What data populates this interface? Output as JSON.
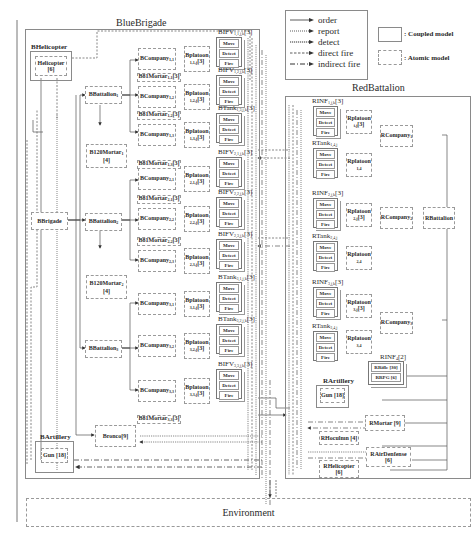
{
  "legend": {
    "edges": [
      {
        "label": "order",
        "style": "solid"
      },
      {
        "label": "report",
        "style": "dotted"
      },
      {
        "label": "detect",
        "style": "dense-dotted"
      },
      {
        "label": "direct fire",
        "style": "dashed"
      },
      {
        "label": "indirect fire",
        "style": "dash-dot"
      }
    ],
    "models": [
      {
        "label": ": Coupled model",
        "style": "solid-box"
      },
      {
        "label": ": Atomic model",
        "style": "dashed-box"
      }
    ]
  },
  "blue": {
    "title": "BlueBrigade",
    "helicopter_group": "BHelicopter",
    "helicopter": "Helicopter",
    "helicopter_count": "[6]",
    "brigade": "BBrigade",
    "battalion1": "BBattalion",
    "battalion1_sub": "1",
    "battalion2": "BBattalion",
    "battalion2_sub": "2",
    "battalion3": "BBattalion",
    "battalion3_sub": "3",
    "mortar120_1": "B120Mortar",
    "mortar120_1_sub": "1",
    "mortar120_1_count": "[4]",
    "mortar120_2": "B120Mortar",
    "mortar120_2_sub": "2",
    "mortar120_2_count": "[4]",
    "bronco": "Bronco[9]",
    "artillery_group": "BArtillery",
    "gun": "Gun [18]",
    "companies": [
      {
        "name": "BCompany",
        "sub": "1,1"
      },
      {
        "name": "BCompany",
        "sub": "1,2"
      },
      {
        "name": "BCompany",
        "sub": "1,3"
      },
      {
        "name": "BCompany",
        "sub": "2,1"
      },
      {
        "name": "BCompany",
        "sub": "2,2"
      },
      {
        "name": "BCompany",
        "sub": "2,3"
      },
      {
        "name": "BCompany",
        "sub": "3,1"
      },
      {
        "name": "BCompany",
        "sub": "3,2"
      },
      {
        "name": "BCompany",
        "sub": "3,3"
      }
    ],
    "platoons": [
      {
        "name": "Bplatoon",
        "sub": "1,1,j",
        "count": "[3]"
      },
      {
        "name": "Bplatoon",
        "sub": "1,2,j",
        "count": "[3]"
      },
      {
        "name": "Bplatoon",
        "sub": "1,3,j",
        "count": "[3]"
      },
      {
        "name": "Bplatoon",
        "sub": "2,1,j",
        "count": "[3]"
      },
      {
        "name": "Bplatoon",
        "sub": "2,2,j",
        "count": "[3]"
      },
      {
        "name": "Bplatoon",
        "sub": "2,3,j",
        "count": "[3]"
      },
      {
        "name": "Bplatoon",
        "sub": "3,1,j",
        "count": "[3]"
      },
      {
        "name": "Bplatoon",
        "sub": "3,2,j",
        "count": "[3]"
      },
      {
        "name": "Bplatoon",
        "sub": "3,3,j",
        "count": "[3]"
      }
    ],
    "vehicles": [
      {
        "name": "BIFV",
        "sub": "1,1,j,k",
        "count": "[3]"
      },
      {
        "name": "BIFV",
        "sub": "1,2,j,k",
        "count": "[3]"
      },
      {
        "name": "BTank",
        "sub": "1,3,j,k",
        "count": "[3]"
      },
      {
        "name": "BIFV",
        "sub": "2,1,j,k",
        "count": "[3]"
      },
      {
        "name": "BIFV",
        "sub": "2,2,j,k",
        "count": "[3]"
      },
      {
        "name": "BIFV",
        "sub": "2,3,j,k",
        "count": "[3]"
      },
      {
        "name": "BTank",
        "sub": "3,1,j,k",
        "count": "[3]"
      },
      {
        "name": "BTank",
        "sub": "3,2,j,k",
        "count": "[3]"
      },
      {
        "name": "BIFV",
        "sub": "3,3,j,k",
        "count": "[3]"
      }
    ],
    "mortars81": [
      {
        "name": "B81Mortar",
        "sub": "1,1",
        "count": "[3]"
      },
      {
        "name": "B81Mortar",
        "sub": "1,2",
        "count": "[3]"
      },
      {
        "name": "B81Mortar",
        "sub": "1,3",
        "count": "[3]"
      },
      {
        "name": "B81Mortar",
        "sub": "2,1",
        "count": "[3]"
      },
      {
        "name": "B81Mortar",
        "sub": "2,2",
        "count": "[3]"
      },
      {
        "name": "B81Mortar",
        "sub": "3,3",
        "count": "[3]"
      }
    ],
    "cell_labels": {
      "move": "Move",
      "detect": "Detect",
      "fire": "Fire"
    }
  },
  "red": {
    "title": "RedBattalion",
    "battalion": "RBattalion",
    "companies": [
      {
        "name": "RCompany",
        "sub": "1"
      },
      {
        "name": "RCompany",
        "sub": "2"
      },
      {
        "name": "RCompany",
        "sub": "3"
      }
    ],
    "platoons": [
      {
        "name": "Rplatoon",
        "sub": "i,j",
        "count": "[3]"
      },
      {
        "name": "Rplatoon",
        "sub": "1,4",
        "count": ""
      },
      {
        "name": "Rplatoon",
        "sub": "2,j",
        "count": "[3]"
      },
      {
        "name": "Rplatoon",
        "sub": "2,4",
        "count": ""
      },
      {
        "name": "Rplatoon",
        "sub": "3,j",
        "count": "[3]"
      },
      {
        "name": "Rplatoon",
        "sub": "3,4",
        "count": ""
      }
    ],
    "vehicles": [
      {
        "name": "RINF",
        "sub": "1,j,k",
        "count": "[3]"
      },
      {
        "name": "RTank",
        "sub": "1,4,j",
        "count": ""
      },
      {
        "name": "RINF",
        "sub": "2,j,k",
        "count": "[3]"
      },
      {
        "name": "RTank",
        "sub": "2,4,j",
        "count": ""
      },
      {
        "name": "RINF",
        "sub": "3,j,k",
        "count": "[3]"
      },
      {
        "name": "RTank",
        "sub": "3,4,j",
        "count": ""
      }
    ],
    "rinf_group": "RINF",
    "rinf_group_sub": "4",
    "rinf_group_count": "[2]",
    "rrifle": "RRifle [30]",
    "rrpg": "RRPG [6]",
    "artillery_group": "RArtillery",
    "gun": "Gun [18]",
    "rmortar": "RMortar [9]",
    "rhoculmn": "RHoculmn [4]",
    "rairdefense": "RAirDenfense",
    "rairdefense_count": "[6]",
    "rhelicopter": "RHelicopter",
    "rhelicopter_count": "[6]"
  },
  "environment": {
    "label": "Environment"
  }
}
